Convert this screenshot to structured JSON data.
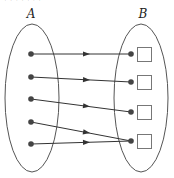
{
  "diagram": {
    "type": "function-mapping",
    "top_fragment": "· · · · · · ·",
    "colors": {
      "ellipse_stroke": "#555555",
      "line": "#333333",
      "dot": "#444444",
      "square_stroke": "#777777",
      "label": "#222222"
    },
    "set_a": {
      "label": "A",
      "label_pos": [
        31,
        18
      ],
      "ellipse": {
        "cx": 32,
        "cy": 98,
        "rx": 27,
        "ry": 74
      },
      "elements": [
        {
          "id": "a1",
          "x": 31,
          "y": 54
        },
        {
          "id": "a2",
          "x": 31,
          "y": 77
        },
        {
          "id": "a3",
          "x": 31,
          "y": 99
        },
        {
          "id": "a4",
          "x": 31,
          "y": 122
        },
        {
          "id": "a5",
          "x": 31,
          "y": 144
        }
      ]
    },
    "set_b": {
      "label": "B",
      "label_pos": [
        143,
        18
      ],
      "ellipse": {
        "cx": 141,
        "cy": 98,
        "rx": 27,
        "ry": 74
      },
      "elements": [
        {
          "id": "b1",
          "dot_x": 131,
          "y": 54,
          "square": {
            "x": 137,
            "y": 47,
            "size": 14
          }
        },
        {
          "id": "b2",
          "dot_x": 131,
          "y": 82,
          "square": {
            "x": 137,
            "y": 75,
            "size": 14
          }
        },
        {
          "id": "b3",
          "dot_x": 131,
          "y": 112,
          "square": {
            "x": 137,
            "y": 105,
            "size": 14
          }
        },
        {
          "id": "b4",
          "dot_x": 131,
          "y": 141,
          "square": {
            "x": 137,
            "y": 134,
            "size": 14
          }
        }
      ]
    },
    "mappings": [
      {
        "from": "a1",
        "to": "b1"
      },
      {
        "from": "a2",
        "to": "b2"
      },
      {
        "from": "a3",
        "to": "b3"
      },
      {
        "from": "a4",
        "to": "b4"
      },
      {
        "from": "a5",
        "to": "b4"
      }
    ],
    "arrow_x": 89
  }
}
